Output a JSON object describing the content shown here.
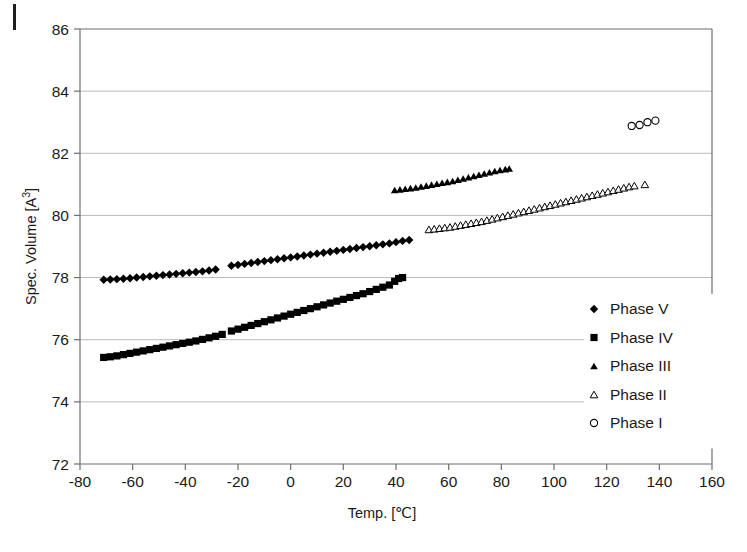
{
  "chart_data": {
    "type": "scatter",
    "title": "",
    "xlabel": "Temp. [℃]",
    "ylabel": "Spec. Volume [A³]",
    "ylabel_base": "Spec. Volume [A",
    "ylabel_sup": "3",
    "ylabel_tail": "]",
    "xlim": [
      -80,
      160
    ],
    "ylim": [
      72,
      86
    ],
    "xticks": [
      -80,
      -60,
      -40,
      -20,
      0,
      20,
      40,
      60,
      80,
      100,
      120,
      140,
      160
    ],
    "yticks": [
      72,
      74,
      76,
      78,
      80,
      82,
      84,
      86
    ],
    "xtick_labels": [
      "-80",
      "-60",
      "-40",
      "-20",
      "0",
      "20",
      "40",
      "60",
      "80",
      "100",
      "120",
      "140",
      "160"
    ],
    "ytick_labels": [
      "72",
      "74",
      "76",
      "78",
      "80",
      "82",
      "84",
      "86"
    ],
    "grid": "horizontal",
    "legend_position": "right-lower-inside",
    "marker_color": "#000000",
    "gridline_color": "#b9b9b9",
    "axis_color": "#6f6f6f",
    "series": [
      {
        "name": "Phase V",
        "marker": "filled-diamond",
        "filled": true,
        "points": [
          [
            -71.0,
            77.93
          ],
          [
            -68.5,
            77.94
          ],
          [
            -66.0,
            77.95
          ],
          [
            -63.5,
            77.96
          ],
          [
            -61.0,
            77.98
          ],
          [
            -58.5,
            78.0
          ],
          [
            -56.0,
            78.02
          ],
          [
            -53.5,
            78.04
          ],
          [
            -51.0,
            78.06
          ],
          [
            -48.5,
            78.08
          ],
          [
            -46.0,
            78.1
          ],
          [
            -43.5,
            78.12
          ],
          [
            -41.0,
            78.14
          ],
          [
            -38.5,
            78.16
          ],
          [
            -36.0,
            78.18
          ],
          [
            -33.5,
            78.2
          ],
          [
            -31.0,
            78.23
          ],
          [
            -28.5,
            78.26
          ],
          [
            -22.5,
            78.38
          ],
          [
            -20.0,
            78.41
          ],
          [
            -17.5,
            78.44
          ],
          [
            -15.0,
            78.47
          ],
          [
            -12.5,
            78.5
          ],
          [
            -10.0,
            78.53
          ],
          [
            -7.5,
            78.56
          ],
          [
            -5.0,
            78.59
          ],
          [
            -2.5,
            78.62
          ],
          [
            0.0,
            78.65
          ],
          [
            2.5,
            78.68
          ],
          [
            5.0,
            78.71
          ],
          [
            7.5,
            78.74
          ],
          [
            10.0,
            78.77
          ],
          [
            12.5,
            78.8
          ],
          [
            15.0,
            78.83
          ],
          [
            17.5,
            78.86
          ],
          [
            20.0,
            78.89
          ],
          [
            22.5,
            78.92
          ],
          [
            25.0,
            78.95
          ],
          [
            27.5,
            78.98
          ],
          [
            30.0,
            79.01
          ],
          [
            32.5,
            79.04
          ],
          [
            35.0,
            79.07
          ],
          [
            37.5,
            79.1
          ],
          [
            40.0,
            79.14
          ],
          [
            42.5,
            79.18
          ],
          [
            45.0,
            79.21
          ]
        ]
      },
      {
        "name": "Phase IV",
        "marker": "filled-square",
        "filled": true,
        "points": [
          [
            -71.0,
            75.43
          ],
          [
            -68.5,
            75.45
          ],
          [
            -66.0,
            75.48
          ],
          [
            -63.5,
            75.52
          ],
          [
            -61.0,
            75.56
          ],
          [
            -58.5,
            75.6
          ],
          [
            -56.0,
            75.64
          ],
          [
            -53.5,
            75.68
          ],
          [
            -51.0,
            75.72
          ],
          [
            -48.5,
            75.76
          ],
          [
            -46.0,
            75.8
          ],
          [
            -43.5,
            75.84
          ],
          [
            -41.0,
            75.88
          ],
          [
            -38.5,
            75.92
          ],
          [
            -36.0,
            75.96
          ],
          [
            -33.5,
            76.01
          ],
          [
            -31.0,
            76.06
          ],
          [
            -28.5,
            76.11
          ],
          [
            -26.0,
            76.17
          ],
          [
            -22.5,
            76.28
          ],
          [
            -20.0,
            76.34
          ],
          [
            -17.5,
            76.4
          ],
          [
            -15.0,
            76.46
          ],
          [
            -12.5,
            76.52
          ],
          [
            -10.0,
            76.58
          ],
          [
            -7.5,
            76.64
          ],
          [
            -5.0,
            76.7
          ],
          [
            -2.5,
            76.76
          ],
          [
            0.0,
            76.82
          ],
          [
            2.5,
            76.88
          ],
          [
            5.0,
            76.94
          ],
          [
            7.5,
            77.0
          ],
          [
            10.0,
            77.06
          ],
          [
            12.5,
            77.12
          ],
          [
            15.0,
            77.18
          ],
          [
            17.5,
            77.24
          ],
          [
            20.0,
            77.3
          ],
          [
            22.5,
            77.36
          ],
          [
            25.0,
            77.42
          ],
          [
            27.5,
            77.48
          ],
          [
            30.0,
            77.55
          ],
          [
            32.5,
            77.62
          ],
          [
            35.0,
            77.69
          ],
          [
            37.5,
            77.76
          ],
          [
            39.5,
            77.88
          ],
          [
            41.0,
            77.97
          ],
          [
            42.5,
            78.0
          ]
        ]
      },
      {
        "name": "Phase III",
        "marker": "filled-triangle",
        "filled": true,
        "points": [
          [
            39.5,
            80.82
          ],
          [
            41.5,
            80.84
          ],
          [
            43.5,
            80.86
          ],
          [
            45.5,
            80.88
          ],
          [
            47.5,
            80.9
          ],
          [
            49.5,
            80.93
          ],
          [
            51.5,
            80.96
          ],
          [
            53.5,
            80.99
          ],
          [
            55.5,
            81.02
          ],
          [
            57.5,
            81.05
          ],
          [
            59.5,
            81.08
          ],
          [
            61.5,
            81.11
          ],
          [
            63.5,
            81.15
          ],
          [
            65.5,
            81.19
          ],
          [
            67.5,
            81.23
          ],
          [
            69.5,
            81.27
          ],
          [
            71.5,
            81.31
          ],
          [
            73.5,
            81.35
          ],
          [
            75.5,
            81.39
          ],
          [
            77.5,
            81.43
          ],
          [
            79.5,
            81.46
          ],
          [
            81.5,
            81.49
          ],
          [
            83.0,
            81.51
          ]
        ]
      },
      {
        "name": "Phase II",
        "marker": "open-triangle",
        "filled": false,
        "points": [
          [
            52.5,
            79.55
          ],
          [
            54.5,
            79.57
          ],
          [
            56.5,
            79.59
          ],
          [
            58.5,
            79.61
          ],
          [
            60.5,
            79.63
          ],
          [
            62.5,
            79.66
          ],
          [
            64.5,
            79.69
          ],
          [
            66.5,
            79.72
          ],
          [
            68.5,
            79.75
          ],
          [
            70.5,
            79.78
          ],
          [
            72.5,
            79.81
          ],
          [
            74.5,
            79.85
          ],
          [
            76.5,
            79.89
          ],
          [
            78.5,
            79.93
          ],
          [
            80.5,
            79.97
          ],
          [
            82.5,
            80.01
          ],
          [
            84.5,
            80.05
          ],
          [
            86.5,
            80.09
          ],
          [
            88.5,
            80.13
          ],
          [
            90.5,
            80.17
          ],
          [
            92.5,
            80.21
          ],
          [
            94.5,
            80.25
          ],
          [
            96.5,
            80.29
          ],
          [
            98.5,
            80.33
          ],
          [
            100.5,
            80.37
          ],
          [
            102.5,
            80.41
          ],
          [
            104.5,
            80.45
          ],
          [
            106.5,
            80.49
          ],
          [
            108.5,
            80.53
          ],
          [
            110.5,
            80.57
          ],
          [
            112.5,
            80.61
          ],
          [
            114.5,
            80.65
          ],
          [
            116.5,
            80.69
          ],
          [
            118.5,
            80.73
          ],
          [
            120.5,
            80.77
          ],
          [
            122.5,
            80.81
          ],
          [
            124.5,
            80.85
          ],
          [
            126.5,
            80.89
          ],
          [
            128.5,
            80.93
          ],
          [
            130.5,
            80.96
          ],
          [
            134.5,
            81.0
          ]
        ]
      },
      {
        "name": "Phase I",
        "marker": "open-circle",
        "filled": false,
        "points": [
          [
            129.5,
            82.88
          ],
          [
            132.5,
            82.91
          ],
          [
            135.5,
            83.0
          ],
          [
            138.5,
            83.05
          ]
        ]
      }
    ]
  },
  "legend": {
    "items": [
      {
        "label": "Phase V",
        "marker": "filled-diamond"
      },
      {
        "label": "Phase IV",
        "marker": "filled-square"
      },
      {
        "label": "Phase III",
        "marker": "filled-triangle"
      },
      {
        "label": "Phase II",
        "marker": "open-triangle"
      },
      {
        "label": "Phase I",
        "marker": "open-circle"
      }
    ]
  }
}
